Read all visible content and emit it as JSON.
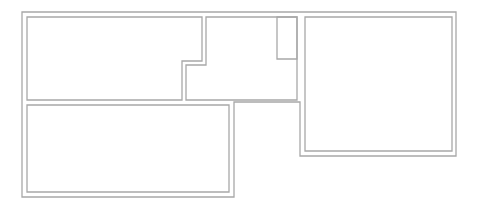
{
  "diagram": {
    "type": "floor-plan",
    "canvas": {
      "width": 480,
      "height": 205,
      "background": "#ffffff"
    },
    "wall_color": "#a8a8a8",
    "outer_wall": {
      "points": "22,12 456,12 456,156 300,156 300,102 234,102 234,197 22,197"
    },
    "rooms": [
      {
        "id": "room-top-left",
        "points": "27,17 202,17 202,61 182,61 182,100 27,100"
      },
      {
        "id": "room-top-middle",
        "points": "206,17 297,17 297,100 186,100 186,65 206,65"
      },
      {
        "id": "closet",
        "points": "277,17 297,17 297,59 277,59"
      },
      {
        "id": "room-bottom-left",
        "points": "27,105 229,105 229,192 27,192"
      },
      {
        "id": "room-right",
        "points": "305,17 452,17 452,151 305,151"
      }
    ]
  }
}
